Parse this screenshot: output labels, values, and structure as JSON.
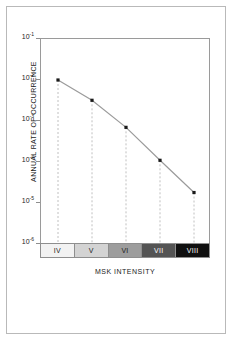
{
  "chart_data": {
    "type": "line",
    "title": "",
    "xlabel": "MSK INTENSITY",
    "ylabel": "ANNUAL RATE OF OCCURRENCE",
    "yscale": "log",
    "ylim": [
      1e-06,
      0.1
    ],
    "grid": false,
    "legend": null,
    "categories": [
      "IV",
      "V",
      "VI",
      "VII",
      "VIII"
    ],
    "values": [
      0.01,
      0.0032,
      0.0007,
      0.00011,
      1.8e-05
    ],
    "series": [
      {
        "name": "Annual rate of occurrence",
        "values": [
          0.01,
          0.0032,
          0.0007,
          0.00011,
          1.8e-05
        ]
      }
    ],
    "y_ticks": [
      {
        "label_mantissa": "10",
        "label_exponent": "-1",
        "value": 0.1
      },
      {
        "label_mantissa": "10",
        "label_exponent": "-2",
        "value": 0.01
      },
      {
        "label_mantissa": "10",
        "label_exponent": "-3",
        "value": 0.001
      },
      {
        "label_mantissa": "10",
        "label_exponent": "-4",
        "value": 0.0001
      },
      {
        "label_mantissa": "10",
        "label_exponent": "-5",
        "value": 1e-05
      },
      {
        "label_mantissa": "10",
        "label_exponent": "-6",
        "value": 1e-06
      }
    ],
    "marker_style": "square",
    "marker_color": "#1a1a1a",
    "line_color": "#9b9b9b",
    "dropline_color": "#b0b0b0",
    "dropline_style": "dashed"
  },
  "axes": {
    "y_title": "ANNUAL RATE OF OCCURRENCE",
    "x_title": "MSK INTENSITY"
  },
  "intensity_scale": {
    "cells": [
      {
        "label": "IV",
        "fill": "#f2f2f2",
        "text_color": "#1a1a1a"
      },
      {
        "label": "V",
        "fill": "#d3d3d3",
        "text_color": "#1a1a1a"
      },
      {
        "label": "VI",
        "fill": "#9d9d9d",
        "text_color": "#1a1a1a"
      },
      {
        "label": "VII",
        "fill": "#545454",
        "text_color": "#ffffff"
      },
      {
        "label": "VIII",
        "fill": "#101010",
        "text_color": "#ffffff"
      }
    ]
  },
  "style": {
    "background": "#ffffff",
    "frame_color": "#b9b9b9",
    "axis_color": "#9a9a9a"
  }
}
